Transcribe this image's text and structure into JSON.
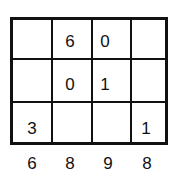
{
  "grid": {
    "rows": 3,
    "cols": 4,
    "cells": [
      [
        "",
        "6",
        "0",
        ""
      ],
      [
        "",
        "0",
        "1",
        ""
      ],
      [
        "3",
        "",
        "",
        "1"
      ]
    ]
  },
  "column_sums": [
    "6",
    "8",
    "9",
    "8"
  ]
}
